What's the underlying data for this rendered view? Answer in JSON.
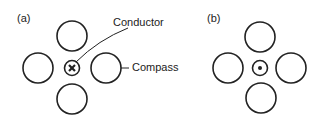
{
  "panels": [
    {
      "label": "(a)",
      "center_symbol": "cross",
      "center_meaning": "current into page",
      "annotations": {
        "conductor": "Conductor",
        "compass": "Compass"
      }
    },
    {
      "label": "(b)",
      "center_symbol": "dot",
      "center_meaning": "current out of page"
    }
  ],
  "colors": {
    "stroke": "#222222",
    "background": "#ffffff"
  }
}
